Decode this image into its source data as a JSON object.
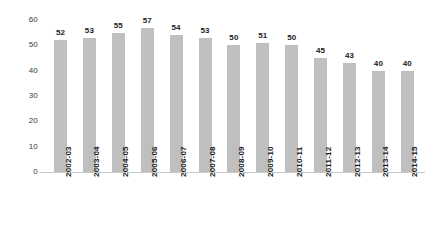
{
  "chart_data": {
    "type": "bar",
    "title": "",
    "subtitle": "",
    "xlabel": "",
    "ylabel": "",
    "grid": false,
    "legend": null,
    "legend_position": "none",
    "ylim": [
      0,
      60
    ],
    "yticks": [
      0,
      10,
      20,
      30,
      40,
      50,
      60
    ],
    "ytick_labels": [
      "0",
      "10",
      "20",
      "30",
      "40",
      "50",
      "60"
    ],
    "categories": [
      "2002-03",
      "2003-04",
      "2004-05",
      "2005-06",
      "2006-07",
      "2007-08",
      "2008-09",
      "2009-10",
      "2010-11",
      "2011-12",
      "2012-13",
      "2013-14",
      "2014-15"
    ],
    "values": [
      52,
      53,
      55,
      57,
      54,
      53,
      50,
      51,
      50,
      45,
      43,
      40,
      40
    ],
    "data_labels": [
      "52",
      "53",
      "55",
      "57",
      "54",
      "53",
      "50",
      "51",
      "50",
      "45",
      "43",
      "40",
      "40"
    ],
    "bar_color": "#bfbfbf",
    "axis_color": "#c8c8c8",
    "label_color": "#1c1c1c",
    "tick_color": "#3a3a3a",
    "background_color": "#ffffff"
  }
}
